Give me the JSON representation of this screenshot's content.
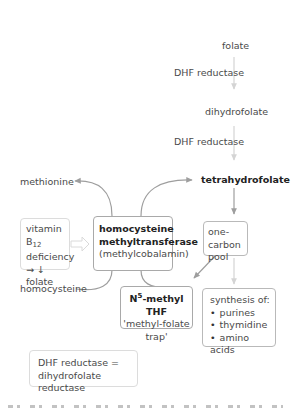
{
  "diagram": {
    "nodes": {
      "folate": "folate",
      "dhf_reductase_1": "DHF reductase",
      "dihydrofolate": "dihydrofolate",
      "dhf_reductase_2": "DHF reductase",
      "tetrahydrofolate": "tetrahydrofolate",
      "methionine": "methionine",
      "homocysteine": "homocysteine",
      "vitamin_b12_box": {
        "line1_prefix": "vitamin B",
        "line1_subscript": "12",
        "line2": "deficiency",
        "line3_arrow": "→",
        "line3_down": "↓",
        "line3_text": "folate"
      },
      "enzyme_box": {
        "line1": "homocysteine",
        "line2": "methyltransferase",
        "line3": "(methylcobalamin)"
      },
      "one_carbon_box": {
        "line1": "one-carbon",
        "line2": "pool"
      },
      "methyl_thf_box": {
        "title_prefix": "N",
        "title_superscript": "5",
        "title_suffix": "-methyl THF",
        "line2": "'methyl-folate",
        "line3": "trap'"
      },
      "synthesis_box": {
        "heading": "synthesis of:",
        "items": [
          "purines",
          "thymidine",
          "amino acids"
        ]
      },
      "legend_box": {
        "line1": "DHF reductase =",
        "line2": "dihydrofolate reductase"
      }
    },
    "colors": {
      "arrow": "#9e9e9e",
      "arrow_light": "#cfcfcf",
      "box_border": "#b9b9b9",
      "text": "#4a4a4a"
    }
  }
}
